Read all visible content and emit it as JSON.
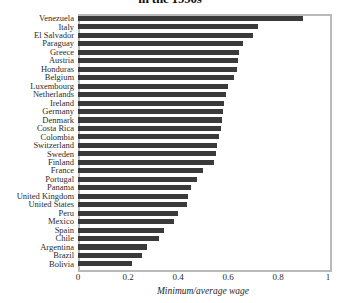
{
  "chart_data": {
    "type": "bar",
    "orientation": "horizontal",
    "title": "in the 1990s",
    "xlabel": "Minimum/average wage",
    "ylabel": "",
    "xlim": [
      0,
      1
    ],
    "xticks": [
      0,
      0.2,
      0.4,
      0.6,
      0.8,
      1
    ],
    "xticklabels": [
      "0",
      "0.2",
      "0.4",
      "0.6",
      "0.8",
      "1"
    ],
    "grid": true,
    "grid_axis": "x",
    "legend": null,
    "bar_color": "#3a3a3a",
    "categories": [
      "Venezuela",
      "Italy",
      "El Salvador",
      "Paraguay",
      "Greece",
      "Austria",
      "Honduras",
      "Belgium",
      "Luxembourg",
      "Netherlands",
      "Ireland",
      "Germany",
      "Denmark",
      "Costa Rica",
      "Colombia",
      "Switzerland",
      "Sweden",
      "Finland",
      "France",
      "Portugal",
      "Panama",
      "United Kingdom",
      "United States",
      "Peru",
      "Mexico",
      "Spain",
      "Chile",
      "Argentina",
      "Brazil",
      "Bolivia"
    ],
    "values": [
      0.9,
      0.72,
      0.7,
      0.66,
      0.645,
      0.64,
      0.635,
      0.625,
      0.6,
      0.59,
      0.585,
      0.58,
      0.575,
      0.57,
      0.565,
      0.555,
      0.55,
      0.545,
      0.5,
      0.475,
      0.45,
      0.44,
      0.435,
      0.4,
      0.385,
      0.345,
      0.325,
      0.275,
      0.255,
      0.215
    ]
  }
}
